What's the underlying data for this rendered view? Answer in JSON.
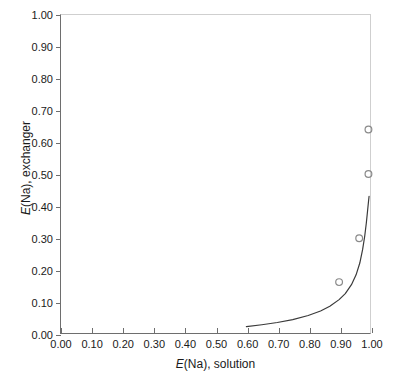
{
  "chart_data": {
    "type": "scatter",
    "title": "",
    "xlabel": "E(Na), solution",
    "ylabel": "E(Na), exchanger",
    "xlabel_italic_prefix": "E",
    "xlabel_rest": "(Na), solution",
    "ylabel_italic_prefix": "E",
    "ylabel_rest": "(Na), exchanger",
    "xlim": [
      0.0,
      1.0
    ],
    "ylim": [
      0.0,
      1.0
    ],
    "grid": false,
    "legend": "none",
    "xticks": [
      "0.00",
      "0.10",
      "0.20",
      "0.30",
      "0.40",
      "0.50",
      "0.60",
      "0.70",
      "0.80",
      "0.90",
      "1.00"
    ],
    "xtick_values": [
      0.0,
      0.1,
      0.2,
      0.3,
      0.4,
      0.5,
      0.6,
      0.7,
      0.8,
      0.9,
      1.0
    ],
    "yticks": [
      "0.00",
      "0.10",
      "0.20",
      "0.30",
      "0.40",
      "0.50",
      "0.60",
      "0.70",
      "0.80",
      "0.90",
      "1.00"
    ],
    "ytick_values": [
      0.0,
      0.1,
      0.2,
      0.3,
      0.4,
      0.5,
      0.6,
      0.7,
      0.8,
      0.9,
      1.0
    ],
    "series": [
      {
        "name": "measured",
        "type": "scatter",
        "marker": "open-circle",
        "color": "#8a8a8a",
        "points": [
          {
            "x": 0.9,
            "y": 0.16
          },
          {
            "x": 0.965,
            "y": 0.298
          },
          {
            "x": 0.995,
            "y": 0.5
          },
          {
            "x": 0.995,
            "y": 0.64
          }
        ]
      },
      {
        "name": "model",
        "type": "line",
        "color": "#3a3a3a",
        "points": [
          {
            "x": 0.6,
            "y": 0.02
          },
          {
            "x": 0.65,
            "y": 0.026
          },
          {
            "x": 0.7,
            "y": 0.033
          },
          {
            "x": 0.75,
            "y": 0.042
          },
          {
            "x": 0.8,
            "y": 0.055
          },
          {
            "x": 0.84,
            "y": 0.069
          },
          {
            "x": 0.87,
            "y": 0.084
          },
          {
            "x": 0.9,
            "y": 0.105
          },
          {
            "x": 0.92,
            "y": 0.124
          },
          {
            "x": 0.94,
            "y": 0.152
          },
          {
            "x": 0.955,
            "y": 0.183
          },
          {
            "x": 0.967,
            "y": 0.22
          },
          {
            "x": 0.976,
            "y": 0.262
          },
          {
            "x": 0.983,
            "y": 0.305
          },
          {
            "x": 0.988,
            "y": 0.345
          },
          {
            "x": 0.992,
            "y": 0.383
          },
          {
            "x": 0.995,
            "y": 0.412
          },
          {
            "x": 0.997,
            "y": 0.43
          }
        ]
      }
    ]
  }
}
